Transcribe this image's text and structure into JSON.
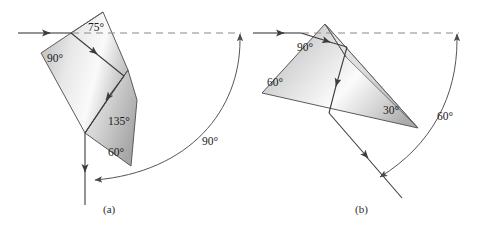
{
  "figure": {
    "background_color": "#ffffff",
    "panels": [
      {
        "id": "a",
        "caption": "(a)",
        "caption_pos": {
          "x": 110,
          "y": 213
        },
        "shape_kind": "rotated rectangular prism with 45-45-90 and 30-60-90 sections",
        "angle_labels": [
          {
            "text": "75°",
            "x": 88,
            "y": 31
          },
          {
            "text": "90°",
            "x": 47,
            "y": 62
          },
          {
            "text": "135°",
            "x": 108,
            "y": 125
          },
          {
            "text": "60°",
            "x": 108,
            "y": 156
          }
        ],
        "deviation_label": {
          "text": "90°",
          "x": 202,
          "y": 145
        },
        "incoming_ray": {
          "from": {
            "x": 18,
            "y": 33
          },
          "to": {
            "x": 71,
            "y": 33
          },
          "style": "solid-with-arrowhead"
        },
        "reference_line": {
          "from": {
            "x": 71,
            "y": 33
          },
          "to": {
            "x": 240,
            "y": 33
          },
          "style": "dashed"
        },
        "exit_ray": {
          "from": {
            "x": 85,
            "y": 133
          },
          "to": {
            "x": 85,
            "y": 205
          },
          "style": "solid-with-arrowhead-downward"
        },
        "deviation_arc": {
          "from": {
            "x": 240,
            "y": 33
          },
          "to": {
            "x": 88,
            "y": 182
          },
          "sweep": "90°"
        }
      },
      {
        "id": "b",
        "caption": "(b)",
        "caption_pos": {
          "x": 362,
          "y": 213
        },
        "shape_kind": "30-60-90 triangular prism",
        "angle_labels": [
          {
            "text": "90°",
            "x": 303,
            "y": 49
          },
          {
            "text": "60°",
            "x": 271,
            "y": 84
          },
          {
            "text": "30°",
            "x": 385,
            "y": 113
          }
        ],
        "deviation_label": {
          "text": "60°",
          "x": 440,
          "y": 120
        },
        "incoming_ray": {
          "from": {
            "x": 253,
            "y": 33
          },
          "to": {
            "x": 300,
            "y": 33
          },
          "style": "solid-with-arrowhead"
        },
        "reference_line": {
          "from": {
            "x": 300,
            "y": 33
          },
          "to": {
            "x": 458,
            "y": 33
          },
          "style": "dashed"
        },
        "exit_ray": {
          "from": {
            "x": 329,
            "y": 113
          },
          "to": {
            "x": 401,
            "y": 197
          },
          "style": "solid-with-arrowhead"
        },
        "deviation_arc": {
          "from": {
            "x": 458,
            "y": 33
          },
          "to": {
            "x": 385,
            "y": 176
          },
          "sweep": "60°"
        }
      }
    ],
    "colors": {
      "prism_fill_light": "#f2f2f2",
      "prism_fill_mid": "#c9c9c9",
      "prism_fill_dark": "#a8a8a8",
      "edge": "#5a5a5a",
      "ray": "#3c3c3c",
      "dashed_ray": "#8a8a8a",
      "arc": "#555555",
      "text": "#1a1a1a"
    }
  }
}
